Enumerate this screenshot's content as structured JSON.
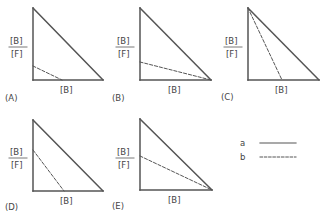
{
  "figure": {
    "y_axis_label": {
      "numerator": "[B]",
      "denominator": "[F]"
    },
    "x_axis_label": "[B]",
    "line_color": "#555555",
    "panels": [
      {
        "id": "A",
        "label": "(A)",
        "dashed_line": {
          "y_intercept_frac": 0.19,
          "x_intercept_frac": 0.41
        }
      },
      {
        "id": "B",
        "label": "(B)",
        "dashed_line": {
          "y_intercept_frac": 0.25,
          "x_intercept_frac": 1.0
        }
      },
      {
        "id": "C",
        "label": "(C)",
        "dashed_line": {
          "y_intercept_frac": 1.0,
          "x_intercept_frac": 0.48
        }
      },
      {
        "id": "D",
        "label": "(D)",
        "dashed_line": {
          "y_intercept_frac": 0.58,
          "x_intercept_frac": 0.44
        }
      },
      {
        "id": "E",
        "label": "(E)",
        "dashed_line": {
          "y_intercept_frac": 0.48,
          "x_intercept_frac": 1.0
        }
      }
    ],
    "legend": [
      {
        "key": "a",
        "style": "solid"
      },
      {
        "key": "b",
        "style": "dashed"
      }
    ]
  }
}
